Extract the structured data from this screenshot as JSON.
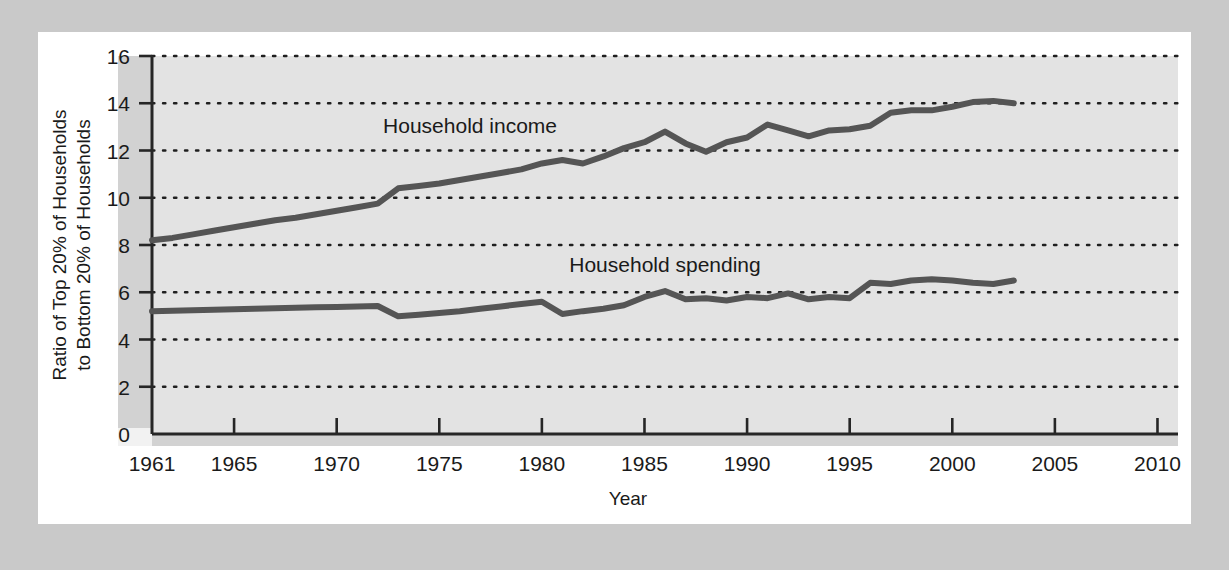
{
  "chart_data": {
    "type": "line",
    "title": "",
    "xlabel": "Year",
    "ylabel": "Ratio of Top 20% of Households to Bottom 20% of Households",
    "ylabel_line1": "Ratio of Top 20% of Households",
    "ylabel_line2": "to Bottom 20% of Households",
    "xlim": [
      1961,
      2011
    ],
    "ylim": [
      0,
      16
    ],
    "grid": true,
    "grid_style": "dotted-horizontal",
    "legend_position": "inline-annotation",
    "x_ticks": [
      1961,
      1965,
      1970,
      1975,
      1980,
      1985,
      1990,
      1995,
      2000,
      2005,
      2010
    ],
    "x_tick_labels": [
      "1961",
      "1965",
      "1970",
      "1975",
      "1980",
      "1985",
      "1990",
      "1995",
      "2000",
      "2005",
      "2010"
    ],
    "y_ticks": [
      0,
      2,
      4,
      6,
      8,
      10,
      12,
      14,
      16
    ],
    "y_tick_labels": [
      "0",
      "2",
      "4",
      "6",
      "8",
      "10",
      "12",
      "14",
      "16"
    ],
    "series": [
      {
        "name": "Household income",
        "label": "Household income",
        "color": "#555555",
        "label_x": 1976.5,
        "label_y": 12.75,
        "x": [
          1961,
          1962,
          1963,
          1964,
          1965,
          1966,
          1967,
          1968,
          1969,
          1970,
          1971,
          1972,
          1973,
          1974,
          1975,
          1976,
          1977,
          1978,
          1979,
          1980,
          1981,
          1982,
          1983,
          1984,
          1985,
          1986,
          1987,
          1988,
          1989,
          1990,
          1991,
          1992,
          1993,
          1994,
          1995,
          1996,
          1997,
          1998,
          1999,
          2000,
          2001,
          2002,
          2003
        ],
        "values": [
          8.2,
          8.3,
          8.45,
          8.6,
          8.75,
          8.9,
          9.05,
          9.15,
          9.3,
          9.45,
          9.6,
          9.75,
          10.4,
          10.5,
          10.6,
          10.75,
          10.9,
          11.05,
          11.2,
          11.45,
          11.6,
          11.45,
          11.75,
          12.1,
          12.35,
          12.8,
          12.3,
          11.95,
          12.35,
          12.55,
          13.1,
          12.85,
          12.6,
          12.85,
          12.9,
          13.05,
          13.6,
          13.7,
          13.7,
          13.85,
          14.05,
          14.1,
          14.0
        ]
      },
      {
        "name": "Household spending",
        "label": "Household spending",
        "color": "#555555",
        "label_x": 1986.0,
        "label_y": 6.85,
        "x": [
          1961,
          1962,
          1963,
          1964,
          1965,
          1966,
          1967,
          1968,
          1969,
          1970,
          1971,
          1972,
          1973,
          1974,
          1975,
          1976,
          1977,
          1978,
          1979,
          1980,
          1981,
          1982,
          1983,
          1984,
          1985,
          1986,
          1987,
          1988,
          1989,
          1990,
          1991,
          1992,
          1993,
          1994,
          1995,
          1996,
          1997,
          1998,
          1999,
          2000,
          2001,
          2002,
          2003
        ],
        "values": [
          5.2,
          5.22,
          5.24,
          5.26,
          5.28,
          5.3,
          5.32,
          5.34,
          5.36,
          5.38,
          5.4,
          5.42,
          4.98,
          5.05,
          5.12,
          5.2,
          5.3,
          5.4,
          5.5,
          5.6,
          5.08,
          5.2,
          5.3,
          5.45,
          5.8,
          6.05,
          5.7,
          5.75,
          5.65,
          5.8,
          5.75,
          5.95,
          5.7,
          5.8,
          5.75,
          6.4,
          6.35,
          6.5,
          6.55,
          6.5,
          6.4,
          6.35,
          6.5
        ]
      }
    ]
  }
}
